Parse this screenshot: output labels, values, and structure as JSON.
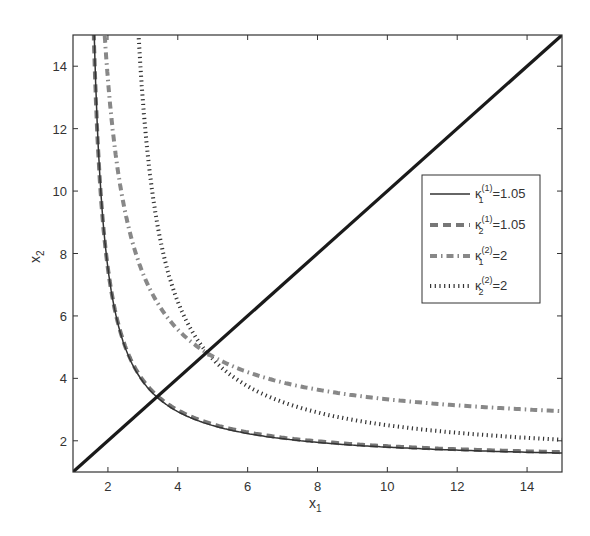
{
  "chart_data": {
    "type": "line",
    "title": "",
    "xlabel": "x1",
    "ylabel": "x2",
    "xlim": [
      1,
      15
    ],
    "ylim": [
      1,
      15
    ],
    "xticks": [
      2,
      4,
      6,
      8,
      10,
      12,
      14
    ],
    "yticks": [
      2,
      4,
      6,
      8,
      10,
      12,
      14
    ],
    "grid": false,
    "legend_position": "right-middle inside",
    "series": [
      {
        "name": "diagonal x2=x1",
        "style": "solid-thick",
        "color": "#1a1a1a",
        "x": [
          1,
          15
        ],
        "y": [
          1,
          15
        ]
      },
      {
        "name": "κ1(1)=1.05",
        "legend": {
          "base": "κ",
          "sub": "1",
          "sup": "(1)",
          "value": "=1.05"
        },
        "style": "solid",
        "color": "#333333",
        "model": {
          "form": "x2 = d + k/(x1 - c)",
          "c": 1.28,
          "k": 4.5,
          "d": 1.28
        },
        "x": [
          1.6,
          2,
          2.5,
          3,
          3.4,
          4,
          5,
          6,
          8,
          10,
          12,
          15
        ],
        "y": [
          15.3,
          7.53,
          4.97,
          3.9,
          3.42,
          2.93,
          2.49,
          2.23,
          1.95,
          1.8,
          1.7,
          1.61
        ]
      },
      {
        "name": "κ2(1)=1.05",
        "legend": {
          "base": "κ",
          "sub": "2",
          "sup": "(1)",
          "value": "=1.05"
        },
        "style": "dashed",
        "color": "#777777",
        "model": {
          "form": "x2 = d + k/(x1 - c)",
          "c": 1.26,
          "k": 4.6,
          "d": 1.3
        },
        "x": [
          1.57,
          2,
          2.5,
          3,
          3.4,
          4,
          5,
          6,
          8,
          10,
          12,
          15
        ],
        "y": [
          15.1,
          7.52,
          5.01,
          3.94,
          3.45,
          2.98,
          2.53,
          2.27,
          1.98,
          1.83,
          1.72,
          1.63
        ]
      },
      {
        "name": "κ1(2)=2",
        "legend": {
          "base": "κ",
          "sub": "1",
          "sup": "(2)",
          "value": "=2"
        },
        "style": "dash-dot-thick",
        "color": "#888888",
        "model": {
          "form": "x2 = d + k/(x1 - c)",
          "c": 1.18,
          "k": 9.26,
          "d": 2.28
        },
        "x": [
          1.97,
          2.5,
          3,
          4,
          4.83,
          6,
          8,
          10,
          12,
          15
        ],
        "y": [
          14.0,
          9.3,
          7.37,
          5.56,
          4.82,
          4.2,
          3.64,
          3.33,
          3.14,
          2.95
        ]
      },
      {
        "name": "κ2(2)=2",
        "legend": {
          "base": "κ",
          "sub": "2",
          "sup": "(2)",
          "value": "=2"
        },
        "style": "dotted",
        "color": "#333333",
        "model": {
          "form": "x2 = d + k/(x1 - c)",
          "c": 2.2,
          "k": 9.27,
          "d": 1.31
        },
        "x": [
          2.9,
          3.5,
          4,
          4.83,
          6,
          8,
          10,
          12,
          15
        ],
        "y": [
          14.55,
          8.44,
          6.46,
          4.83,
          3.75,
          2.91,
          2.5,
          2.26,
          2.03
        ]
      }
    ],
    "annotations": [
      {
        "text": "κ(1) curves intersect diagonal",
        "x": 3.4,
        "y": 3.4
      },
      {
        "text": "κ(2) curves intersect diagonal",
        "x": 4.83,
        "y": 4.83
      }
    ]
  },
  "axes": {
    "x_label_main": "x",
    "x_label_sub": "1",
    "y_label_main": "x",
    "y_label_sub": "2",
    "x_tick_labels": [
      "2",
      "4",
      "6",
      "8",
      "10",
      "12",
      "14"
    ],
    "y_tick_labels": [
      "2",
      "4",
      "6",
      "8",
      "10",
      "12",
      "14"
    ]
  },
  "legend": {
    "entries": [
      {
        "base": "κ",
        "sub": "1",
        "sup": "(1)",
        "value": "=1.05"
      },
      {
        "base": "κ",
        "sub": "2",
        "sup": "(1)",
        "value": "=1.05"
      },
      {
        "base": "κ",
        "sub": "1",
        "sup": "(2)",
        "value": "=2"
      },
      {
        "base": "κ",
        "sub": "2",
        "sup": "(2)",
        "value": "=2"
      }
    ]
  }
}
